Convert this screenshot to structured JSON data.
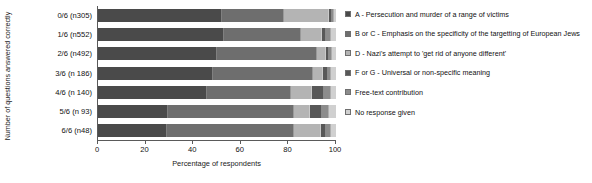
{
  "chart_data": {
    "type": "bar",
    "orientation": "horizontal",
    "stacked": true,
    "stack_mode": "percent",
    "title": "",
    "xlabel": "Percentage of respondents",
    "ylabel": "Number of questions answered correctly",
    "xlim": [
      0,
      100
    ],
    "xticks": [
      0,
      20,
      40,
      60,
      80,
      100
    ],
    "xtick_labels": [
      "0",
      "20",
      "40",
      "60",
      "80",
      "100"
    ],
    "grid": false,
    "legend_position": "right",
    "categories": [
      "0/6 (n305)",
      "1/6 (n552)",
      "2/6 (n492)",
      "3/6 (n 186)",
      "4/6 (n 140)",
      "5/6 (n 93)",
      "6/6 (n48)"
    ],
    "series": [
      {
        "name": "A - Persecution and murder of a range of victims",
        "color": "#4a4a4a",
        "values": [
          52.0,
          53.0,
          50.0,
          48.5,
          46.0,
          29.5,
          29.0
        ]
      },
      {
        "name": "B or C - Emphasis on the specificity of the targetting of European Jews",
        "color": "#6e6e6e",
        "values": [
          26.0,
          32.5,
          42.0,
          42.0,
          35.0,
          53.0,
          53.5
        ]
      },
      {
        "name": "D - Nazi's attempt to 'get rid of anyone different'",
        "color": "#b4b4b4",
        "values": [
          19.0,
          8.5,
          4.0,
          4.0,
          9.0,
          6.5,
          11.0
        ]
      },
      {
        "name": "F or G - Universal or non-specific meaning",
        "color": "#585858",
        "values": [
          1.2,
          2.0,
          1.2,
          2.0,
          5.0,
          5.0,
          2.5
        ]
      },
      {
        "name": "Free-text contribution",
        "color": "#8c8c8c",
        "values": [
          0.8,
          2.0,
          1.0,
          1.5,
          3.0,
          3.0,
          2.0
        ]
      },
      {
        "name": "No response given",
        "color": "#d0d0d0",
        "values": [
          1.0,
          2.0,
          1.8,
          2.0,
          2.0,
          3.0,
          2.0
        ]
      }
    ]
  }
}
